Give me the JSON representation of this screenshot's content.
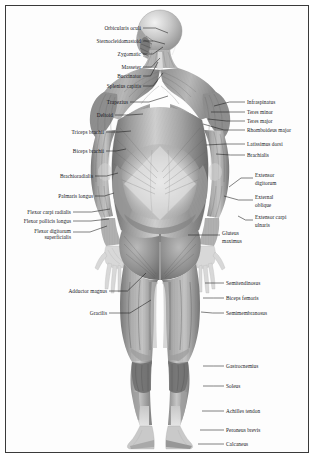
{
  "plate": {
    "title": "Posterior view of the human muscular system",
    "view": "posterior",
    "frame_color": "#3a3a3a",
    "background_color": "#ffffff",
    "label_color": "#15161a",
    "leader_color": "#1a1a1a"
  },
  "labels_left": [
    {
      "text": "Orbicularis oculi",
      "x": 141,
      "y": 26,
      "lx": 143,
      "ly": 28,
      "tx": 168,
      "ty": 33
    },
    {
      "text": "Sternocleidomastoid",
      "x": 141,
      "y": 39,
      "lx": 143,
      "ly": 41,
      "tx": 165,
      "ty": 44
    },
    {
      "text": "Zygomatic",
      "x": 141,
      "y": 52,
      "lx": 143,
      "ly": 54,
      "tx": 163,
      "ty": 47
    },
    {
      "text": "Masseter",
      "x": 141,
      "y": 65,
      "lx": 143,
      "ly": 67,
      "tx": 160,
      "ty": 58
    },
    {
      "text": "Buccinator",
      "x": 141,
      "y": 74,
      "lx": 143,
      "ly": 76,
      "tx": 158,
      "ty": 62
    },
    {
      "text": "Splenius capitis",
      "x": 141,
      "y": 84,
      "lx": 143,
      "ly": 86,
      "tx": 163,
      "ty": 73
    },
    {
      "text": "Trapezius",
      "x": 128,
      "y": 100,
      "lx": 130,
      "ly": 102,
      "tx": 168,
      "ty": 96
    },
    {
      "text": "Deltoid",
      "x": 113,
      "y": 113,
      "lx": 115,
      "ly": 115,
      "tx": 143,
      "ty": 114
    },
    {
      "text": "Triceps brachii",
      "x": 104,
      "y": 130,
      "lx": 106,
      "ly": 132,
      "tx": 131,
      "ty": 131
    },
    {
      "text": "Biceps brachii",
      "x": 104,
      "y": 149,
      "lx": 106,
      "ly": 151,
      "tx": 126,
      "ty": 149
    },
    {
      "text": "Brachioradialis",
      "x": 93,
      "y": 174,
      "lx": 95,
      "ly": 176,
      "tx": 118,
      "ty": 173
    },
    {
      "text": "Palmaris longus",
      "x": 93,
      "y": 194,
      "lx": 95,
      "ly": 196,
      "tx": 114,
      "ty": 193
    },
    {
      "text": "Flexor carpi radialis",
      "x": 71,
      "y": 210,
      "lx": 73,
      "ly": 212,
      "tx": 110,
      "ty": 209
    },
    {
      "text": "Flexor pollicis longus",
      "x": 71,
      "y": 219,
      "lx": 73,
      "ly": 221,
      "tx": 109,
      "ty": 219
    },
    {
      "text": "Flexor digitorum",
      "x": 71,
      "y": 229,
      "lx": 73,
      "ly": 232,
      "tx": 107,
      "ty": 226
    },
    {
      "text": "superficialis",
      "x": 71,
      "y": 235,
      "lx": null,
      "ly": null,
      "tx": null,
      "ty": null
    },
    {
      "text": "Adductor magnus",
      "x": 107,
      "y": 289,
      "lx": 109,
      "ly": 291,
      "tx": 146,
      "ty": 273
    },
    {
      "text": "Gracilis",
      "x": 107,
      "y": 311,
      "lx": 109,
      "ly": 313,
      "tx": 151,
      "ty": 300
    }
  ],
  "labels_right": [
    {
      "text": "Infraspinatus",
      "x": 247,
      "y": 100,
      "lx": 245,
      "ly": 102,
      "tx": 214,
      "ty": 106
    },
    {
      "text": "Teres minor",
      "x": 247,
      "y": 110,
      "lx": 245,
      "ly": 112,
      "tx": 211,
      "ty": 112
    },
    {
      "text": "Teres major",
      "x": 247,
      "y": 119,
      "lx": 245,
      "ly": 121,
      "tx": 208,
      "ty": 119
    },
    {
      "text": "Rhomboideus major",
      "x": 247,
      "y": 128,
      "lx": 245,
      "ly": 130,
      "tx": 203,
      "ty": 124
    },
    {
      "text": "Latissimus dorsi",
      "x": 247,
      "y": 142,
      "lx": 245,
      "ly": 144,
      "tx": 206,
      "ty": 145
    },
    {
      "text": "Brachialis",
      "x": 247,
      "y": 153,
      "lx": 245,
      "ly": 155,
      "tx": 216,
      "ty": 154
    },
    {
      "text": "Extensor",
      "x": 255,
      "y": 173,
      "lx": 253,
      "ly": 178,
      "tx": 229,
      "ty": 187
    },
    {
      "text": "digitorum",
      "x": 255,
      "y": 181,
      "lx": null,
      "ly": null,
      "tx": null,
      "ty": null
    },
    {
      "text": "External",
      "x": 255,
      "y": 195,
      "lx": 253,
      "ly": 200,
      "tx": 224,
      "ty": 196
    },
    {
      "text": "oblique",
      "x": 255,
      "y": 203,
      "lx": null,
      "ly": null,
      "tx": null,
      "ty": null
    },
    {
      "text": "Extensor carpi",
      "x": 255,
      "y": 215,
      "lx": 253,
      "ly": 220,
      "tx": 238,
      "ty": 216
    },
    {
      "text": "ulnaris",
      "x": 255,
      "y": 223,
      "lx": null,
      "ly": null,
      "tx": null,
      "ty": null
    },
    {
      "text": "Gluteus",
      "x": 222,
      "y": 231,
      "lx": 220,
      "ly": 235,
      "tx": 188,
      "ty": 235
    },
    {
      "text": "maximus",
      "x": 222,
      "y": 239,
      "lx": null,
      "ly": null,
      "tx": null,
      "ty": null
    },
    {
      "text": "Semitendinosus",
      "x": 226,
      "y": 281,
      "lx": 224,
      "ly": 283,
      "tx": 205,
      "ty": 283
    },
    {
      "text": "Biceps femoris",
      "x": 226,
      "y": 296,
      "lx": 224,
      "ly": 298,
      "tx": 203,
      "ty": 298
    },
    {
      "text": "Semimembranosus",
      "x": 226,
      "y": 311,
      "lx": 224,
      "ly": 313,
      "tx": 201,
      "ty": 312
    },
    {
      "text": "Gastrocnemius",
      "x": 226,
      "y": 364,
      "lx": 224,
      "ly": 366,
      "tx": 203,
      "ty": 366
    },
    {
      "text": "Soleus",
      "x": 226,
      "y": 384,
      "lx": 224,
      "ly": 386,
      "tx": 203,
      "ty": 386
    },
    {
      "text": "Achilles tendon",
      "x": 226,
      "y": 409,
      "lx": 224,
      "ly": 411,
      "tx": 202,
      "ty": 411
    },
    {
      "text": "Peroneus brevis",
      "x": 226,
      "y": 428,
      "lx": 224,
      "ly": 430,
      "tx": 200,
      "ty": 430
    },
    {
      "text": "Calcaneus",
      "x": 226,
      "y": 442,
      "lx": 224,
      "ly": 444,
      "tx": 198,
      "ty": 444
    }
  ]
}
